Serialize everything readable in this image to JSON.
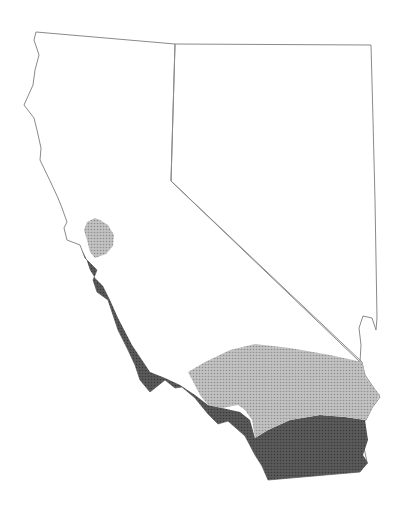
{
  "map": {
    "description": "Outline map of California and Nevada with two shaded (halftone) range regions in southern/central-coastal California",
    "states": [
      "California",
      "Nevada"
    ],
    "colors": {
      "background": "#ffffff",
      "outline": "#8a8a8a",
      "dark_region": "#555555",
      "light_region": "#b0b0b0"
    },
    "regions": [
      {
        "name": "dark-shaded-region",
        "shade": "dark",
        "extent": "central coast to San Diego / Imperial area"
      },
      {
        "name": "light-shaded-region",
        "shade": "light",
        "extent": "San Francisco Bay area and Mojave/inland southern California"
      }
    ]
  }
}
